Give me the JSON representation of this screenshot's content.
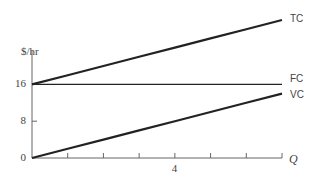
{
  "chart_data": {
    "type": "line",
    "title": "",
    "xlabel": "Q",
    "ylabel": "$/hr",
    "x": [
      0,
      1,
      2,
      3,
      4,
      5,
      6,
      7
    ],
    "x_ticks": [
      1,
      2,
      3,
      4,
      5,
      6,
      7
    ],
    "x_tick_labels": [
      "",
      "",
      "",
      "4",
      "",
      "",
      ""
    ],
    "y_ticks": [
      0,
      8,
      16
    ],
    "y_tick_labels": [
      "0",
      "8",
      "16"
    ],
    "xlim": [
      0,
      7
    ],
    "ylim": [
      0,
      32
    ],
    "grid": false,
    "legend": "inline labels at line ends",
    "series": [
      {
        "name": "TC",
        "values": [
          16,
          18,
          20,
          22,
          24,
          26,
          28,
          30
        ],
        "color": "#222222",
        "width": 2.2
      },
      {
        "name": "FC",
        "values": [
          16,
          16,
          16,
          16,
          16,
          16,
          16,
          16
        ],
        "color": "#222222",
        "width": 1.3
      },
      {
        "name": "VC",
        "values": [
          0,
          2,
          4,
          6,
          8,
          10,
          12,
          14
        ],
        "color": "#222222",
        "width": 2.2
      }
    ]
  }
}
